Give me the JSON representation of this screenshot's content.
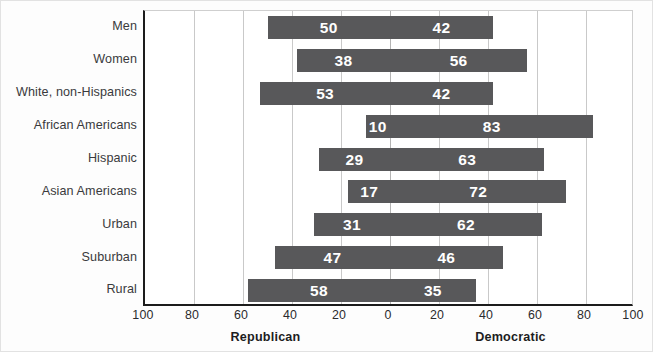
{
  "chart_data": {
    "type": "bar",
    "orientation": "horizontal",
    "subtype": "diverging-bidirectional",
    "title": "",
    "subtitle": "",
    "xlabel": "",
    "ylabel": "",
    "xlim": [
      -100,
      100
    ],
    "grid": true,
    "legend": null,
    "axis_left_caption": "Republican",
    "axis_right_caption": "Democratic",
    "tick_labels": [
      "100",
      "80",
      "60",
      "40",
      "20",
      "0",
      "20",
      "40",
      "60",
      "80",
      "100"
    ],
    "tick_values": [
      -100,
      -80,
      -60,
      -40,
      -20,
      0,
      20,
      40,
      60,
      80,
      100
    ],
    "categories": [
      "Men",
      "Women",
      "White, non-Hispanics",
      "African Americans",
      "Hispanic",
      "Asian Americans",
      "Urban",
      "Suburban",
      "Rural"
    ],
    "series": [
      {
        "name": "Republican",
        "direction": "left",
        "values": [
          50,
          38,
          53,
          10,
          29,
          17,
          31,
          47,
          58
        ]
      },
      {
        "name": "Democratic",
        "direction": "right",
        "values": [
          42,
          56,
          42,
          83,
          63,
          72,
          62,
          46,
          35
        ]
      }
    ],
    "bar_color": "#58585a",
    "value_label_color": "#ffffff",
    "axis_color": "#1c1c1c",
    "grid_color": "#c9c9c9"
  }
}
